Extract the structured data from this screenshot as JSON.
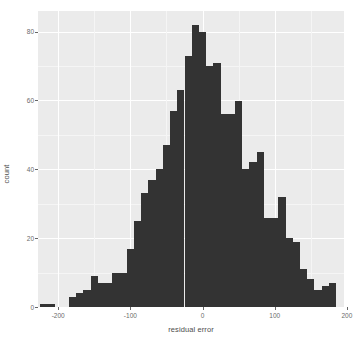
{
  "chart_data": {
    "type": "bar",
    "chart_subtype": "histogram",
    "title": "",
    "xlabel": "residual error",
    "ylabel": "count",
    "xlim": [
      -228,
      196
    ],
    "ylim": [
      0,
      86
    ],
    "grid": true,
    "legend": false,
    "bin_width": 10,
    "bar_color": "#333333",
    "panel_color": "#ebebeb",
    "gridline_color": "#ffffff",
    "xticks": [
      -200,
      -100,
      0,
      100,
      200
    ],
    "xtick_labels": [
      "-200",
      "-100",
      "0",
      "100",
      "200"
    ],
    "yticks": [
      0,
      20,
      40,
      60,
      80
    ],
    "ytick_labels": [
      "0",
      "20",
      "40",
      "60",
      "80"
    ],
    "bin_centers": [
      -220,
      -210,
      -200,
      -190,
      -180,
      -170,
      -160,
      -150,
      -140,
      -130,
      -120,
      -110,
      -100,
      -90,
      -80,
      -70,
      -60,
      -50,
      -40,
      -30,
      -20,
      -10,
      0,
      10,
      20,
      30,
      40,
      50,
      60,
      70,
      80,
      90,
      100,
      110,
      120,
      130,
      140,
      150,
      160,
      170,
      180
    ],
    "values": [
      1,
      1,
      0,
      0,
      3,
      4,
      5,
      9,
      7,
      7,
      10,
      10,
      17,
      25,
      33,
      37,
      40,
      47,
      57,
      63,
      73,
      82,
      80,
      70,
      71,
      56,
      56,
      60,
      40,
      42,
      45,
      26,
      26,
      32,
      20,
      19,
      11,
      8,
      5,
      6,
      7
    ]
  },
  "axis": {
    "y_title": "count",
    "x_title": "residual error"
  }
}
